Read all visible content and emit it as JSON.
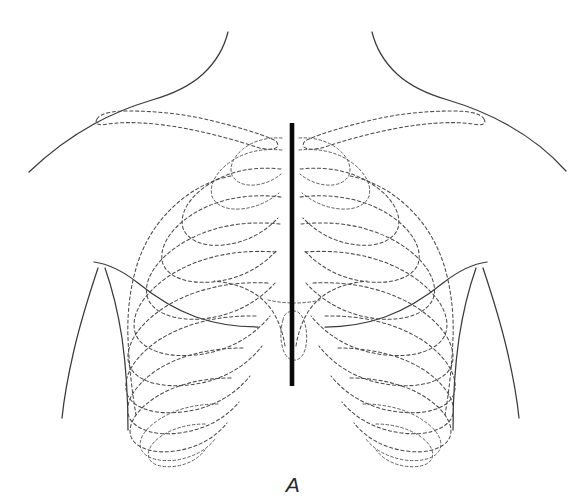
{
  "figure": {
    "panel_label": "A",
    "label_position": {
      "x": 293,
      "y": 492
    },
    "background_color": "#ffffff",
    "canvas": {
      "width": 579,
      "height": 504
    }
  },
  "style": {
    "soft_tissue_stroke": "#3b3b3b",
    "bone_stroke": "#4a4a4a",
    "midline_stroke": "#0a0a0a",
    "bone_dash_pattern": "3.2 2.6",
    "soft_tissue_line_width": 1.25,
    "bone_line_width": 1.05,
    "midline_line_width": 4.6
  },
  "structures": {
    "soft_tissue": [
      {
        "name": "neck-left-border",
        "label": "Left lateral neck contour",
        "line_style": "solid"
      },
      {
        "name": "neck-right-border",
        "label": "Right lateral neck contour",
        "line_style": "solid"
      },
      {
        "name": "shoulder-left-contour",
        "label": "Left shoulder and deltoid contour",
        "line_style": "solid"
      },
      {
        "name": "shoulder-right-contour",
        "label": "Right shoulder and deltoid contour",
        "line_style": "solid"
      },
      {
        "name": "axillary-fold-left",
        "label": "Left anterior axillary fold",
        "line_style": "solid"
      },
      {
        "name": "axillary-fold-right",
        "label": "Right anterior axillary fold",
        "line_style": "solid"
      },
      {
        "name": "arm-left-medial",
        "label": "Left upper arm medial border",
        "line_style": "solid"
      },
      {
        "name": "arm-right-medial",
        "label": "Right upper arm medial border",
        "line_style": "solid"
      },
      {
        "name": "arm-left-lateral",
        "label": "Left upper arm lateral border",
        "line_style": "solid"
      },
      {
        "name": "arm-right-lateral",
        "label": "Right upper arm lateral border",
        "line_style": "solid"
      }
    ],
    "skeletal": [
      {
        "name": "clavicle-left",
        "label": "Left clavicle",
        "line_style": "dashed"
      },
      {
        "name": "clavicle-right",
        "label": "Right clavicle",
        "line_style": "dashed"
      },
      {
        "name": "sternum-midline",
        "label": "Sternum / median sternal line",
        "line_style": "solid-heavy"
      },
      {
        "name": "costal-margin-left",
        "label": "Left costal margin",
        "line_style": "dashed"
      },
      {
        "name": "costal-margin-right",
        "label": "Right costal margin",
        "line_style": "dashed"
      },
      {
        "name": "xiphoid-process",
        "label": "Xiphoid process",
        "line_style": "dashed"
      }
    ],
    "ribs": {
      "count_per_side": 12,
      "left_side_label": "Ribs 1-12, left hemithorax",
      "right_side_label": "Ribs 1-12, right hemithorax",
      "line_style": "dashed",
      "numbers": [
        1,
        2,
        3,
        4,
        5,
        6,
        7,
        8,
        9,
        10,
        11,
        12
      ]
    }
  },
  "view": {
    "orientation": "anterior",
    "subject": "Thoracic cage surface projection",
    "description": "Anterior view of the thorax showing the skeletal outline of the ribs, clavicles and sternum projected beneath the body surface contour."
  }
}
